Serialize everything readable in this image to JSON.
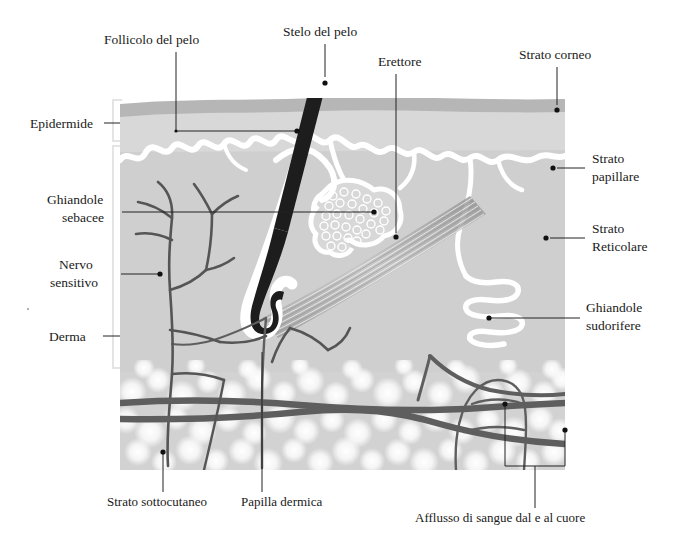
{
  "diagram": {
    "language": "it",
    "colors": {
      "background": "#ffffff",
      "stratum_corneum": "#b6b6b6",
      "epidermis": "#d8d8d8",
      "papillary_outline": "#ffffff",
      "dermis": "#cfcfcf",
      "subcutaneous": "#d2d2d2",
      "fat_cells": "#f7f7f7",
      "hair": "#1d1d1d",
      "nerve": "#555555",
      "vessel": "#5e5e5e",
      "leader_line": "#222222",
      "text": "#1a1a1a",
      "bracket": "#e2e2e2"
    },
    "labels": [
      {
        "id": "follicolo-del-pelo",
        "text": "Follicolo del pelo",
        "text_x": 104,
        "text_y": 44,
        "anchor": "start"
      },
      {
        "id": "stelo-del-pelo",
        "text": "Stelo del pelo",
        "text_x": 283,
        "text_y": 36,
        "anchor": "start"
      },
      {
        "id": "erettore",
        "text": "Erettore",
        "text_x": 378,
        "text_y": 66,
        "anchor": "start"
      },
      {
        "id": "strato-corneo",
        "text": "Strato corneo",
        "text_x": 519,
        "text_y": 59,
        "anchor": "start"
      },
      {
        "id": "epidermide",
        "text": "Epidermide",
        "text_x": 30,
        "text_y": 128,
        "anchor": "start"
      },
      {
        "id": "strato-papillare-line1",
        "text": "Strato",
        "text_x": 592,
        "text_y": 163,
        "anchor": "start"
      },
      {
        "id": "strato-papillare-line2",
        "text": "papillare",
        "text_x": 592,
        "text_y": 181,
        "anchor": "start"
      },
      {
        "id": "ghiandole-sebacee-line1",
        "text": "Ghiandole",
        "text_x": 47,
        "text_y": 204,
        "anchor": "start"
      },
      {
        "id": "ghiandole-sebacee-line2",
        "text": "sebacee",
        "text_x": 62,
        "text_y": 222,
        "anchor": "start"
      },
      {
        "id": "strato-reticolare-line1",
        "text": "Strato",
        "text_x": 592,
        "text_y": 233,
        "anchor": "start"
      },
      {
        "id": "strato-reticolare-line2",
        "text": "Reticolare",
        "text_x": 592,
        "text_y": 251,
        "anchor": "start"
      },
      {
        "id": "nervo-sensitivo-line1",
        "text": "Nervo",
        "text_x": 59,
        "text_y": 269,
        "anchor": "start"
      },
      {
        "id": "nervo-sensitivo-line2",
        "text": "sensitivo",
        "text_x": 50,
        "text_y": 287,
        "anchor": "start"
      },
      {
        "id": "ghiandole-sudorifere-line1",
        "text": "Ghiandole",
        "text_x": 586,
        "text_y": 312,
        "anchor": "start"
      },
      {
        "id": "ghiandole-sudorifere-line2",
        "text": "sudorifere",
        "text_x": 586,
        "text_y": 330,
        "anchor": "start"
      },
      {
        "id": "derma",
        "text": "Derma",
        "text_x": 49,
        "text_y": 341,
        "anchor": "start"
      },
      {
        "id": "strato-sottocutaneo",
        "text": "Strato sottocutaneo",
        "text_x": 107,
        "text_y": 506,
        "anchor": "start"
      },
      {
        "id": "papilla-dermica",
        "text": "Papilla dermica",
        "text_x": 241,
        "text_y": 506,
        "anchor": "start"
      },
      {
        "id": "afflusso-di-sangue",
        "text": "Afflusso di sangue dal e al cuore",
        "text_x": 415,
        "text_y": 522,
        "anchor": "start"
      }
    ]
  }
}
